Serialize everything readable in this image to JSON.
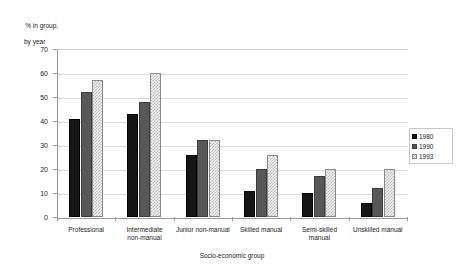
{
  "chart_data": {
    "type": "bar",
    "title": "",
    "ylabel_line1": "% in group,",
    "ylabel_line2": "by year",
    "xlabel": "Socio-economic group",
    "categories": [
      "Professional",
      "Intermediate\nnon-manual",
      "Junior non-manual",
      "Skilled manual",
      "Semi-skilled\nmanual",
      "Unskilled manual"
    ],
    "series": [
      {
        "name": "1980",
        "values": [
          41,
          43,
          26,
          11,
          10,
          6
        ]
      },
      {
        "name": "1990",
        "values": [
          52,
          48,
          32,
          20,
          17,
          12
        ]
      },
      {
        "name": "1993",
        "values": [
          57,
          60,
          32,
          26,
          20,
          20
        ]
      }
    ],
    "ylim": [
      0,
      70
    ],
    "ytick_labels": [
      "0",
      "10",
      "20",
      "30",
      "40",
      "50",
      "60",
      "70"
    ],
    "ytick_values": [
      0,
      10,
      20,
      30,
      40,
      50,
      60,
      70
    ],
    "grid": true,
    "legend_position": "right",
    "colors": {
      "series_1980": "#151515",
      "series_1990": "#585858",
      "series_1993": "#f2f2f2",
      "axis": "#9a9a9a",
      "gridline": "#d8d8d8",
      "text": "#1a1a1a",
      "background": "#ffffff"
    }
  }
}
